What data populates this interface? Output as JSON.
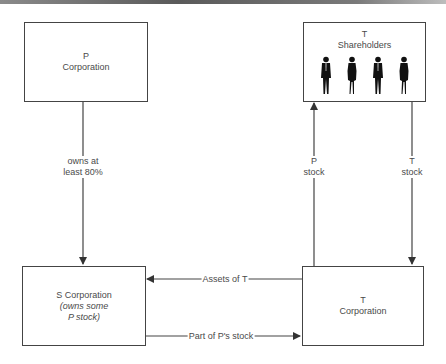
{
  "diagram": {
    "type": "ownership-flow",
    "nodes": {
      "p_corp": {
        "line1": "P",
        "line2": "Corporation"
      },
      "t_shareholders": {
        "line1": "T",
        "line2": "Shareholders",
        "figures": [
          "man",
          "woman",
          "man",
          "woman"
        ]
      },
      "s_corp": {
        "line1": "S Corporation",
        "line2": "(owns some",
        "line3": "P stock)"
      },
      "t_corp": {
        "line1": "T",
        "line2": "Corporation"
      }
    },
    "edges": {
      "p_to_s": {
        "line1": "owns at",
        "line2": "least 80%",
        "from": "P Corporation",
        "to": "S Corporation"
      },
      "p_stock": {
        "line1": "P",
        "line2": "stock",
        "from": "T Corporation",
        "to": "T Shareholders"
      },
      "t_stock": {
        "line1": "T",
        "line2": "stock",
        "from": "T Shareholders",
        "to": "T Corporation"
      },
      "assets": {
        "label": "Assets of T",
        "from": "T Corporation",
        "to": "S Corporation"
      },
      "part_stock": {
        "label": "Part of P's stock",
        "from": "S Corporation",
        "to": "T Corporation"
      }
    }
  },
  "colors": {
    "line": "#444444",
    "text": "#4a4a4a",
    "background": "#ffffff"
  }
}
